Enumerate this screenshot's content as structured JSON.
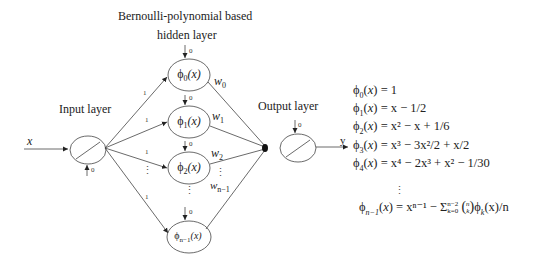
{
  "title": {
    "line1": "Bernoulli-polynomial based",
    "line2": "hidden layer"
  },
  "layers": {
    "input": "Input layer",
    "output": "Output layer"
  },
  "input_var": "x",
  "output_var": "y",
  "bias_label": "0",
  "edge_weight_input": "1",
  "hidden_nodes": [
    {
      "base": "ϕ",
      "sub": "0",
      "arg": "(x)"
    },
    {
      "base": "ϕ",
      "sub": "1",
      "arg": "(x)"
    },
    {
      "base": "ϕ",
      "sub": "2",
      "arg": "(x)"
    },
    {
      "base": "ϕ",
      "sub": "n−1",
      "arg": "(x)"
    }
  ],
  "output_weights": [
    {
      "base": "w",
      "sub": "0"
    },
    {
      "base": "w",
      "sub": "1"
    },
    {
      "base": "w",
      "sub": "2"
    },
    {
      "base": "w",
      "sub": "n−1"
    }
  ],
  "equations": [
    {
      "lhs_sub": "0",
      "rhs": "= 1"
    },
    {
      "lhs_sub": "1",
      "rhs": "= x − 1/2"
    },
    {
      "lhs_sub": "2",
      "rhs": "= x² − x + 1/6"
    },
    {
      "lhs_sub": "3",
      "rhs": "= x³ − 3x²/2 + x/2"
    },
    {
      "lhs_sub": "4",
      "rhs": "= x⁴ − 2x³ + x² − 1/30"
    },
    {
      "lhs_sub": "n−1",
      "rhs": "= xⁿ⁻¹ − Σ"
    }
  ],
  "general_eq": {
    "sum_upper": "n−2",
    "sum_lower": "k=0",
    "binom_top": "n",
    "binom_bottom": "k",
    "tail": "ϕ",
    "tail_sub": "k",
    "tail_end": "(x)/n"
  },
  "ellipsis": "⋮"
}
